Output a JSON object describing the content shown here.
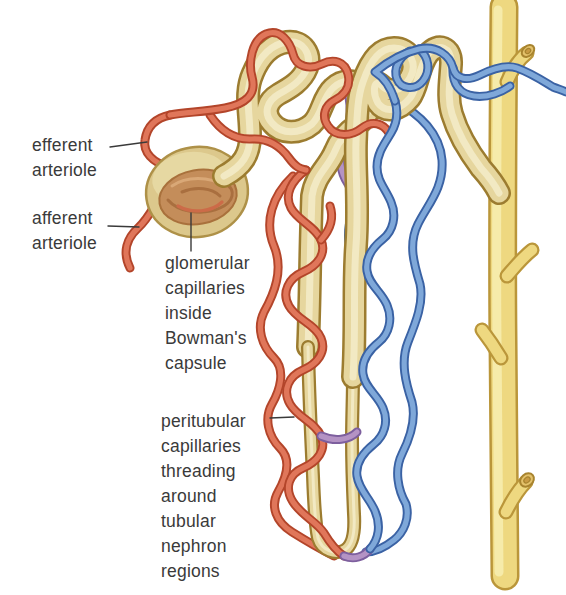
{
  "labels": {
    "efferent_arteriole": {
      "lines": [
        "efferent",
        "arteriole"
      ]
    },
    "afferent_arteriole": {
      "lines": [
        "afferent",
        "arteriole"
      ]
    },
    "glomerular_capillaries": {
      "lines": [
        "glomerular",
        "capillaries",
        "inside",
        "Bowman's",
        "capsule"
      ]
    },
    "peritubular_capillaries": {
      "lines": [
        "peritubular",
        "capillaries",
        "threading",
        "around",
        "tubular",
        "nephron",
        "regions"
      ]
    }
  },
  "colors": {
    "background": "#ffffff",
    "arterial_red": "#e0765a",
    "venous_blue": "#7fa8d9",
    "capillary_purple": "#b493c4",
    "tubule_tan": "#e6d69e",
    "collecting_duct_yellow": "#eed880",
    "capsule_tan": "#dcc88c",
    "glomerulus_tuft_brown": "#c48d5a",
    "label_text": "#3a3a3a"
  }
}
